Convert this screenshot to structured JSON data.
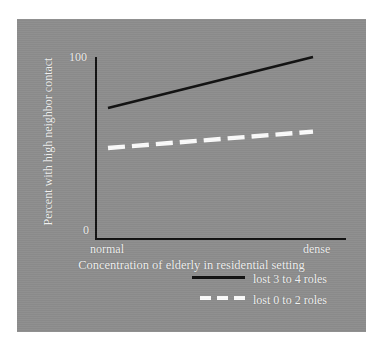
{
  "figure": {
    "background_color": "#8d8d8d",
    "outer_color": "#ffffff",
    "axis_color": "#111111",
    "text_color": "#f2f2f2"
  },
  "chart_data": {
    "type": "line",
    "title": "",
    "xlabel": "Concentration of elderly in residential setting",
    "ylabel": "Percent with high neighbor contact",
    "x": [
      "normal",
      "dense"
    ],
    "xticklabels": [
      "normal",
      "dense"
    ],
    "yticklabels": [
      "0",
      "100"
    ],
    "ylim": [
      0,
      100
    ],
    "grid": false,
    "legend_position": "below-axes-center",
    "series": [
      {
        "name": "lost 3 to 4 roles",
        "style": "solid",
        "color": "#111111",
        "values": [
          72,
          100
        ]
      },
      {
        "name": "lost 0 to 2 roles",
        "style": "dashed",
        "color": "#fbfbfb",
        "values": [
          50,
          59
        ]
      }
    ]
  },
  "axes": {
    "y_tick_top": "100",
    "y_tick_bottom": "0",
    "x_tick_left": "normal",
    "x_tick_right": "dense",
    "y_title": "Percent with high neighbor contact",
    "x_title": "Concentration of elderly in residential setting"
  },
  "legend": {
    "items": [
      {
        "label": "lost 3 to 4 roles",
        "style": "solid",
        "color": "#111111"
      },
      {
        "label": "lost 0 to 2 roles",
        "style": "dashed",
        "color": "#fbfbfb"
      }
    ]
  }
}
